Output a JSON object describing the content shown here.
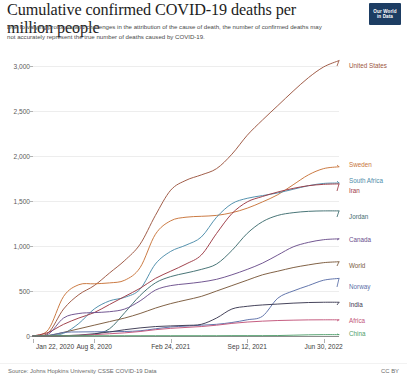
{
  "header": {
    "title": "Cumulative confirmed COVID-19 deaths per million people",
    "subtitle": "Due to varying protocols and challenges in the attribution of the cause of death, the number of confirmed deaths may not accurately represent the true number of deaths caused by COVID-19.",
    "logo_line1": "Our World",
    "logo_line2": "in Data"
  },
  "footer": {
    "source": "Source: Johns Hopkins University CSSE COVID-19 Data",
    "license": "CC BY"
  },
  "chart_data": {
    "type": "line",
    "title": "Cumulative confirmed COVID-19 deaths per million people",
    "subtitle": "Due to varying protocols and challenges in the attribution of the cause of death, the number of confirmed deaths may not accurately represent the true number of deaths caused by COVID-19.",
    "xlabel": "",
    "ylabel": "",
    "ylim": [
      0,
      3000
    ],
    "yticks": [
      0,
      500,
      1000,
      1500,
      2000,
      2500,
      3000
    ],
    "ytick_labels": [
      "0",
      "500",
      "1,000",
      "1,500",
      "2,000",
      "2,500",
      "3,000"
    ],
    "grid": true,
    "legend_position": "right-inline-labels",
    "xticks": [
      0,
      0.2,
      0.45,
      0.7,
      0.95
    ],
    "xtick_labels": [
      "Jan 22, 2020",
      "Aug 8, 2020",
      "Feb 24, 2021",
      "Sep 12, 2021",
      "Jun 30, 2022"
    ],
    "x": [
      0,
      0.05,
      0.1,
      0.15,
      0.2,
      0.25,
      0.3,
      0.35,
      0.4,
      0.45,
      0.5,
      0.55,
      0.6,
      0.65,
      0.7,
      0.75,
      0.8,
      0.85,
      0.9,
      0.95,
      1
    ],
    "series": [
      {
        "name": "United States",
        "color": "#9c5540",
        "label_y": 66,
        "final_value": 3060,
        "values": [
          0,
          35,
          300,
          460,
          560,
          700,
          840,
          1020,
          1340,
          1620,
          1730,
          1790,
          1860,
          2020,
          2230,
          2400,
          2560,
          2720,
          2870,
          2990,
          3060
        ]
      },
      {
        "name": "Sweden",
        "color": "#c8743a",
        "label_y": 165,
        "final_value": 1880,
        "values": [
          0,
          70,
          440,
          570,
          580,
          590,
          620,
          760,
          1130,
          1280,
          1320,
          1330,
          1340,
          1370,
          1420,
          1490,
          1570,
          1680,
          1790,
          1860,
          1880
        ]
      },
      {
        "name": "South Africa",
        "color": "#4c8caa",
        "label_y": 181,
        "final_value": 1700,
        "values": [
          0,
          2,
          30,
          140,
          300,
          390,
          430,
          520,
          800,
          940,
          1010,
          1100,
          1320,
          1470,
          1530,
          1560,
          1590,
          1630,
          1670,
          1695,
          1700
        ]
      },
      {
        "name": "Iran",
        "color": "#9c3a44",
        "label_y": 191,
        "final_value": 1690,
        "values": [
          0,
          40,
          130,
          200,
          260,
          350,
          440,
          530,
          640,
          720,
          800,
          900,
          1140,
          1360,
          1490,
          1550,
          1600,
          1640,
          1670,
          1685,
          1690
        ]
      },
      {
        "name": "Jordan",
        "color": "#3f6e70",
        "label_y": 217,
        "final_value": 1390,
        "values": [
          0,
          0,
          2,
          5,
          20,
          80,
          260,
          450,
          590,
          660,
          700,
          740,
          800,
          950,
          1140,
          1270,
          1340,
          1370,
          1385,
          1390,
          1390
        ]
      },
      {
        "name": "Canada",
        "color": "#6b4f8c",
        "label_y": 240,
        "final_value": 1080,
        "values": [
          0,
          20,
          200,
          250,
          260,
          270,
          300,
          390,
          510,
          560,
          580,
          600,
          630,
          680,
          740,
          810,
          900,
          990,
          1040,
          1070,
          1080
        ]
      },
      {
        "name": "World",
        "color": "#7a5a3c",
        "label_y": 266,
        "final_value": 825,
        "values": [
          0,
          5,
          40,
          80,
          120,
          160,
          200,
          250,
          310,
          360,
          400,
          440,
          500,
          560,
          620,
          680,
          720,
          760,
          790,
          815,
          825
        ]
      },
      {
        "name": "Norway",
        "color": "#5b6fa8",
        "label_y": 287,
        "final_value": 640,
        "values": [
          0,
          5,
          40,
          45,
          47,
          48,
          50,
          58,
          80,
          100,
          110,
          120,
          130,
          150,
          180,
          220,
          420,
          500,
          560,
          620,
          640
        ]
      },
      {
        "name": "India",
        "color": "#3c3a52",
        "label_y": 305,
        "final_value": 375,
        "values": [
          0,
          0,
          3,
          10,
          25,
          45,
          70,
          90,
          105,
          112,
          118,
          130,
          200,
          300,
          330,
          345,
          355,
          365,
          372,
          375,
          375
        ]
      },
      {
        "name": "Africa",
        "color": "#c2557a",
        "label_y": 321,
        "final_value": 180,
        "values": [
          0,
          0,
          3,
          8,
          15,
          25,
          35,
          50,
          70,
          85,
          95,
          105,
          120,
          140,
          155,
          165,
          172,
          176,
          179,
          180,
          180
        ]
      },
      {
        "name": "China",
        "color": "#4f9e6a",
        "label_y": 334,
        "final_value": 15,
        "values": [
          0,
          2,
          3,
          3,
          3,
          3,
          3,
          3,
          3,
          3,
          3,
          3,
          3,
          4,
          4,
          4,
          5,
          9,
          13,
          15,
          15
        ]
      }
    ]
  }
}
